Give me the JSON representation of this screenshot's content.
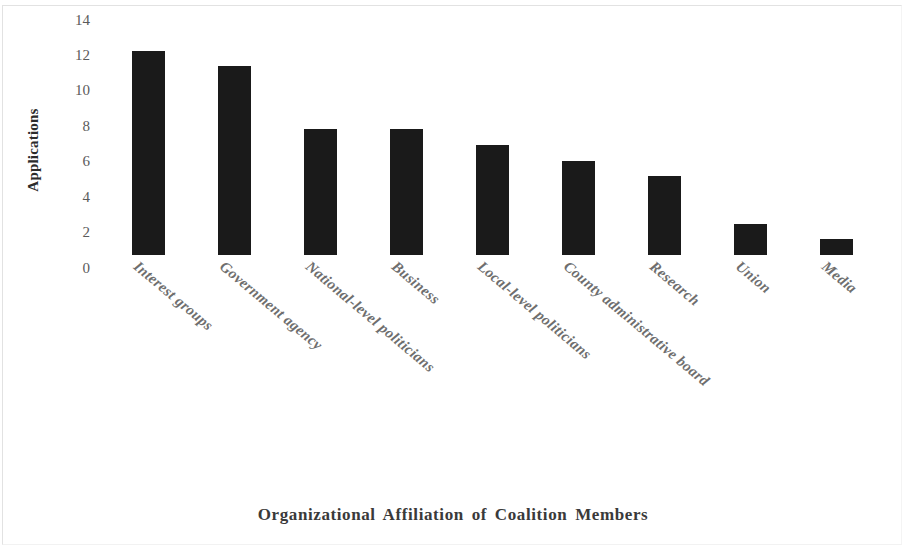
{
  "chart_data": {
    "type": "bar",
    "title": "",
    "subtitle": "",
    "xlabel": "Organizational Affiliation of Coalition Members",
    "ylabel": "Applications",
    "categories": [
      "Interest groups",
      "Government agency",
      "National-level politicians",
      "Business",
      "Local-level politicians",
      "County administrative board",
      "Research",
      "Union",
      "Media"
    ],
    "values": [
      13,
      12,
      8,
      8,
      7,
      6,
      5,
      2,
      1
    ],
    "ylim": [
      0,
      14
    ],
    "ytick_labels": [
      "14",
      "12",
      "10",
      "8",
      "6",
      "4",
      "2",
      "0"
    ],
    "ytick_values": [
      14,
      12,
      10,
      8,
      6,
      4,
      2,
      0
    ],
    "grid": false,
    "legend": "none",
    "bar_color": "#1a1a1a",
    "background_color": "#ffffff",
    "axis_text_color": "#5a5a5a",
    "category_label_rotation_deg": 40
  }
}
